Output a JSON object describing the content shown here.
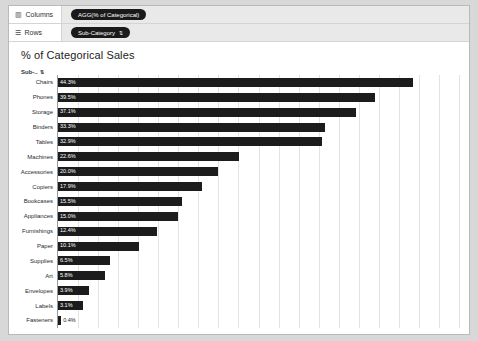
{
  "shelves": [
    {
      "name": "columns",
      "label": "Columns",
      "glyph": "▥",
      "pill": {
        "text": "AGG(% of Categorical)",
        "sort": ""
      }
    },
    {
      "name": "rows",
      "label": "Rows",
      "glyph": "☰",
      "pill": {
        "text": "Sub-Category",
        "sort": "⇅"
      }
    }
  ],
  "viz": {
    "title": "% of Categorical Sales",
    "row_header": "Sub-..",
    "row_header_sort": "⇅"
  },
  "chart_data": {
    "type": "bar",
    "title": "% of Categorical Sales",
    "orientation": "horizontal",
    "xlabel": "",
    "ylabel": "Sub-Category",
    "xlim": [
      0,
      50
    ],
    "grid": true,
    "legend": "none",
    "categories": [
      "Chairs",
      "Phones",
      "Storage",
      "Binders",
      "Tables",
      "Machines",
      "Accessories",
      "Copiers",
      "Bookcases",
      "Appliances",
      "Furnishings",
      "Paper",
      "Supplies",
      "Art",
      "Envelopes",
      "Labels",
      "Fasteners"
    ],
    "values": [
      44.3,
      39.5,
      37.1,
      33.3,
      32.9,
      22.6,
      20.0,
      17.9,
      15.5,
      15.0,
      12.4,
      10.1,
      6.5,
      5.8,
      3.9,
      3.1,
      0.4
    ],
    "labels": [
      "44.3%",
      "39.5%",
      "37.1%",
      "33.3%",
      "32.9%",
      "22.6%",
      "20.0%",
      "17.9%",
      "15.5%",
      "15.0%",
      "12.4%",
      "10.1%",
      "6.5%",
      "5.8%",
      "3.9%",
      "3.1%",
      "0.4%"
    ],
    "colors": {
      "bar": "#1c1c1c",
      "grid": "#e3e3e3",
      "axis": "#9a9a9a"
    }
  }
}
